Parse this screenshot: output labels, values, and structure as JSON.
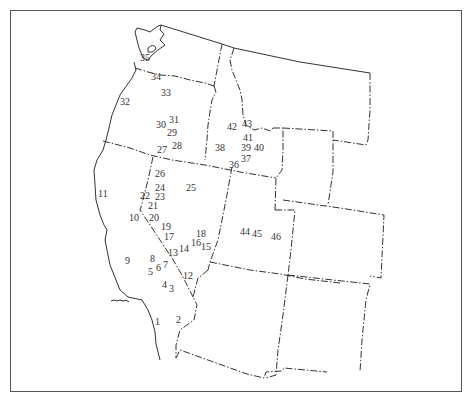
{
  "map": {
    "title": "",
    "region": "Western United States",
    "colors": {
      "line": "#333333",
      "frame": "#555555",
      "background": "#ffffff"
    },
    "sites": [
      {
        "id": "1",
        "label": "1",
        "x": 160,
        "y": 322
      },
      {
        "id": "2",
        "label": "2",
        "x": 181,
        "y": 320
      },
      {
        "id": "3",
        "label": "3",
        "x": 174,
        "y": 289
      },
      {
        "id": "4",
        "label": "4",
        "x": 167,
        "y": 285
      },
      {
        "id": "5",
        "label": "5",
        "x": 153,
        "y": 272
      },
      {
        "id": "6",
        "label": "6",
        "x": 161,
        "y": 268
      },
      {
        "id": "7",
        "label": "7",
        "x": 168,
        "y": 265
      },
      {
        "id": "8",
        "label": "8",
        "x": 155,
        "y": 259
      },
      {
        "id": "9",
        "label": "9",
        "x": 130,
        "y": 261
      },
      {
        "id": "10",
        "label": "10",
        "x": 134,
        "y": 218
      },
      {
        "id": "11",
        "label": "11",
        "x": 103,
        "y": 194
      },
      {
        "id": "12",
        "label": "12",
        "x": 188,
        "y": 276
      },
      {
        "id": "13",
        "label": "13",
        "x": 173,
        "y": 253
      },
      {
        "id": "14",
        "label": "14",
        "x": 184,
        "y": 249
      },
      {
        "id": "15",
        "label": "15",
        "x": 206,
        "y": 247
      },
      {
        "id": "16",
        "label": "16",
        "x": 196,
        "y": 243
      },
      {
        "id": "17",
        "label": "17",
        "x": 169,
        "y": 237
      },
      {
        "id": "18",
        "label": "18",
        "x": 201,
        "y": 234
      },
      {
        "id": "19",
        "label": "19",
        "x": 166,
        "y": 227
      },
      {
        "id": "20",
        "label": "20",
        "x": 154,
        "y": 218
      },
      {
        "id": "21",
        "label": "21",
        "x": 153,
        "y": 206
      },
      {
        "id": "22",
        "label": "22",
        "x": 145,
        "y": 196
      },
      {
        "id": "23",
        "label": "23",
        "x": 160,
        "y": 197
      },
      {
        "id": "24",
        "label": "24",
        "x": 160,
        "y": 188
      },
      {
        "id": "25",
        "label": "25",
        "x": 191,
        "y": 188
      },
      {
        "id": "26",
        "label": "26",
        "x": 160,
        "y": 174
      },
      {
        "id": "27",
        "label": "27",
        "x": 162,
        "y": 150
      },
      {
        "id": "28",
        "label": "28",
        "x": 177,
        "y": 146
      },
      {
        "id": "29",
        "label": "29",
        "x": 172,
        "y": 133
      },
      {
        "id": "30",
        "label": "30",
        "x": 161,
        "y": 125
      },
      {
        "id": "31",
        "label": "31",
        "x": 174,
        "y": 120
      },
      {
        "id": "32",
        "label": "32",
        "x": 125,
        "y": 102
      },
      {
        "id": "33",
        "label": "33",
        "x": 166,
        "y": 93
      },
      {
        "id": "34",
        "label": "34",
        "x": 156,
        "y": 77
      },
      {
        "id": "35",
        "label": "35",
        "x": 145,
        "y": 58
      },
      {
        "id": "36",
        "label": "36",
        "x": 234,
        "y": 165
      },
      {
        "id": "37",
        "label": "37",
        "x": 246,
        "y": 159
      },
      {
        "id": "38",
        "label": "38",
        "x": 220,
        "y": 148
      },
      {
        "id": "39",
        "label": "39",
        "x": 246,
        "y": 148
      },
      {
        "id": "40",
        "label": "40",
        "x": 259,
        "y": 148
      },
      {
        "id": "41",
        "label": "41",
        "x": 248,
        "y": 138
      },
      {
        "id": "42",
        "label": "42",
        "x": 232,
        "y": 127
      },
      {
        "id": "43",
        "label": "43",
        "x": 247,
        "y": 124
      },
      {
        "id": "44",
        "label": "44",
        "x": 245,
        "y": 232
      },
      {
        "id": "45",
        "label": "45",
        "x": 257,
        "y": 234
      },
      {
        "id": "46",
        "label": "46",
        "x": 276,
        "y": 237
      }
    ]
  }
}
